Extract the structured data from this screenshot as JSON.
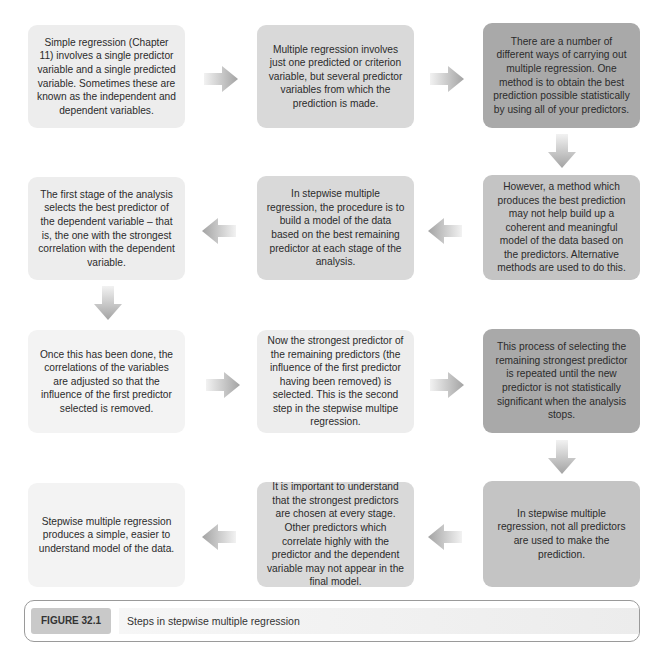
{
  "diagram": {
    "boxes": [
      {
        "id": "b1",
        "text": "Simple regression (Chapter 11) involves a single predictor variable and a single predicted variable. Sometimes these are known as the independent and dependent variables."
      },
      {
        "id": "b2",
        "text": "Multiple regression involves just one predicted or criterion variable, but several predictor variables from which the prediction is made."
      },
      {
        "id": "b3",
        "text": "There are a number of different ways of carrying out multiple regression. One method is to obtain the best prediction possible statistically by using all of your predictors."
      },
      {
        "id": "b4",
        "text": "However, a method which produces the best prediction may not help build up a coherent and meaningful model of the data based on the predictors. Alternative methods are used to do this."
      },
      {
        "id": "b5",
        "text": "In stepwise multiple regression, the procedure is to build a model of the data based on the best remaining predictor at each stage of the analysis."
      },
      {
        "id": "b6",
        "text": "The first stage of the analysis selects the best predictor of the dependent variable – that is, the one with the strongest correlation with the dependent variable."
      },
      {
        "id": "b7",
        "text": "Once this has been done, the correlations of the variables are adjusted so that the influence of the first predictor selected is removed."
      },
      {
        "id": "b8",
        "text": "Now the strongest predictor of the remaining predictors (the influence of the first predictor having been removed) is selected. This is the second step in the stepwise multipe regression."
      },
      {
        "id": "b9",
        "text": "This process of selecting the remaining strongest predictor is repeated until the new predictor is not statistically significant when the analysis stops."
      },
      {
        "id": "b10",
        "text": "In stepwise multiple regression, not all predictors are used to make the prediction."
      },
      {
        "id": "b11",
        "text": "It is important to understand that the strongest predictors are chosen at every stage. Other predictors which correlate highly with the predictor and the dependent variable may not appear in the final model."
      },
      {
        "id": "b12",
        "text": "Stepwise multiple regression produces a simple, easier to understand model of the data."
      }
    ],
    "arrows": [
      {
        "from": "b1",
        "to": "b2",
        "direction": "right"
      },
      {
        "from": "b2",
        "to": "b3",
        "direction": "right"
      },
      {
        "from": "b3",
        "to": "b4",
        "direction": "down"
      },
      {
        "from": "b4",
        "to": "b5",
        "direction": "left"
      },
      {
        "from": "b5",
        "to": "b6",
        "direction": "left"
      },
      {
        "from": "b6",
        "to": "b7",
        "direction": "down"
      },
      {
        "from": "b7",
        "to": "b8",
        "direction": "right"
      },
      {
        "from": "b8",
        "to": "b9",
        "direction": "right"
      },
      {
        "from": "b9",
        "to": "b10",
        "direction": "down"
      },
      {
        "from": "b10",
        "to": "b11",
        "direction": "left"
      },
      {
        "from": "b11",
        "to": "b12",
        "direction": "left"
      }
    ]
  },
  "caption": {
    "label": "FIGURE 32.1",
    "title": "Steps in stepwise multiple regression"
  },
  "colors": {
    "arrow": "#a8a8a8",
    "border": "#9a9a9a"
  }
}
